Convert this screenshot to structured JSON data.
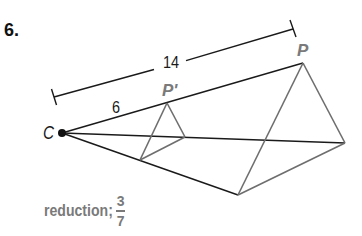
{
  "problem": {
    "number": "6."
  },
  "diagram": {
    "center_label": "C",
    "image_point_label": "P'",
    "original_point_label": "P",
    "dimensions": {
      "outer_length": "14",
      "inner_length": "6"
    },
    "colors": {
      "line_dark": "#1a1a1a",
      "line_gray": "#6e6e6e",
      "label_gray": "#7a7a7a"
    }
  },
  "answer": {
    "type_label": "reduction;",
    "fraction_numerator": "3",
    "fraction_denominator": "7"
  }
}
